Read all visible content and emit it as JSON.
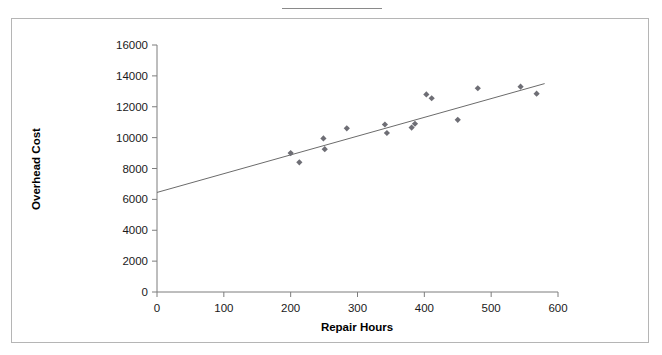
{
  "figure": {
    "background_color": "#ffffff",
    "frame_color": "#b5b5b5",
    "top_rule_color": "#8a8a8a"
  },
  "chart_data": {
    "type": "scatter",
    "title": "",
    "subtitle": "",
    "xlabel": "Repair Hours",
    "ylabel": "Overhead Cost",
    "xlim": [
      0,
      600
    ],
    "ylim": [
      0,
      16000
    ],
    "xticks": [
      0,
      100,
      200,
      300,
      400,
      500,
      600
    ],
    "yticks": [
      0,
      2000,
      4000,
      6000,
      8000,
      10000,
      12000,
      14000,
      16000
    ],
    "xtick_labels": [
      "0",
      "100",
      "200",
      "300",
      "400",
      "500",
      "600"
    ],
    "ytick_labels": [
      "0",
      "2000",
      "4000",
      "6000",
      "8000",
      "10000",
      "12000",
      "14000",
      "16000"
    ],
    "grid": false,
    "legend": false,
    "legend_position": "none",
    "marker_color": "#6e6e75",
    "marker_shape": "diamond",
    "line_color": "#6b6b6b",
    "series": [
      {
        "name": "Overhead Cost vs Repair Hours",
        "type": "scatter",
        "points": [
          {
            "x": 200,
            "y": 9000
          },
          {
            "x": 213,
            "y": 8400
          },
          {
            "x": 249,
            "y": 9950
          },
          {
            "x": 251,
            "y": 9250
          },
          {
            "x": 284,
            "y": 10600
          },
          {
            "x": 341,
            "y": 10850
          },
          {
            "x": 344,
            "y": 10300
          },
          {
            "x": 381,
            "y": 10650
          },
          {
            "x": 386,
            "y": 10900
          },
          {
            "x": 403,
            "y": 12800
          },
          {
            "x": 411,
            "y": 12550
          },
          {
            "x": 450,
            "y": 11150
          },
          {
            "x": 480,
            "y": 13200
          },
          {
            "x": 544,
            "y": 13300
          },
          {
            "x": 568,
            "y": 12850
          }
        ]
      },
      {
        "name": "fitted regression line",
        "type": "line",
        "endpoints": [
          {
            "x": 0,
            "y": 6450
          },
          {
            "x": 580,
            "y": 13500
          }
        ]
      }
    ]
  }
}
